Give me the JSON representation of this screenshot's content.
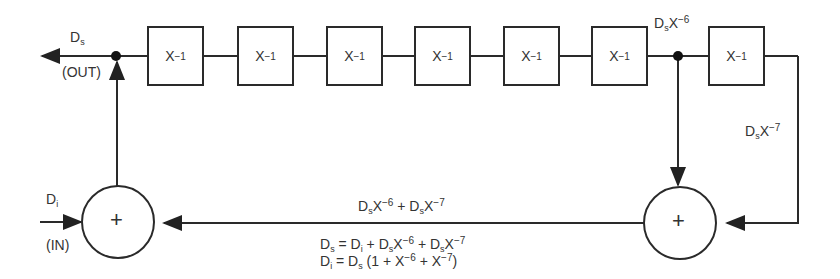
{
  "diagram": {
    "delay_elements": [
      {
        "label_base": "X",
        "label_exp": "−1"
      },
      {
        "label_base": "X",
        "label_exp": "−1"
      },
      {
        "label_base": "X",
        "label_exp": "−1"
      },
      {
        "label_base": "X",
        "label_exp": "−1"
      },
      {
        "label_base": "X",
        "label_exp": "−1"
      },
      {
        "label_base": "X",
        "label_exp": "−1"
      },
      {
        "label_base": "X",
        "label_exp": "−1"
      }
    ],
    "output": {
      "signal": "D",
      "signal_sub": "s",
      "tag": "(OUT)"
    },
    "input": {
      "signal": "D",
      "signal_sub": "i",
      "tag": "(IN)"
    },
    "tap6": {
      "base": "D",
      "sub": "s",
      "x": "X",
      "exp": "−6"
    },
    "tap7": {
      "base": "D",
      "sub": "s",
      "x": "X",
      "exp": "−7"
    },
    "adders": [
      {
        "symbol": "+"
      },
      {
        "symbol": "+"
      }
    ],
    "feedback_label": {
      "a_base": "D",
      "a_sub": "s",
      "a_x": "X",
      "a_exp": "−6",
      "op": "+",
      "b_base": "D",
      "b_sub": "s",
      "b_x": "X",
      "b_exp": "−7"
    },
    "equations": [
      {
        "lhs": "D",
        "lhs_sub": "s",
        "rhs": "= D",
        "rhs_sub": "i",
        "rest1": " + D",
        "rest1_sub": "s",
        "x1": "X",
        "exp1": "−6",
        "rest2": " + D",
        "rest2_sub": "s",
        "x2": "X",
        "exp2": "−7",
        "tail": ""
      },
      {
        "lhs": "D",
        "lhs_sub": "i",
        "rhs": "= D",
        "rhs_sub": "s",
        "rest1": " (1 + X",
        "exp1": "−6",
        "rest2": " + X",
        "exp2": "−7",
        "tail": ")"
      }
    ]
  }
}
